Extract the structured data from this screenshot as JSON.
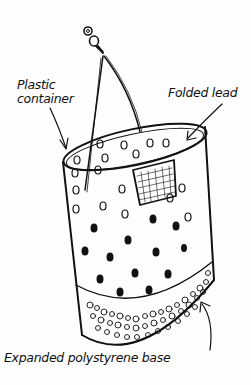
{
  "diagram": {
    "labels": {
      "container_line1": "Plastic",
      "container_line2": "container",
      "folded_lid": "Folded lead",
      "base": "Expanded polystyrene base"
    },
    "colors": {
      "ink": "#111111",
      "background": "#fefefe"
    }
  }
}
